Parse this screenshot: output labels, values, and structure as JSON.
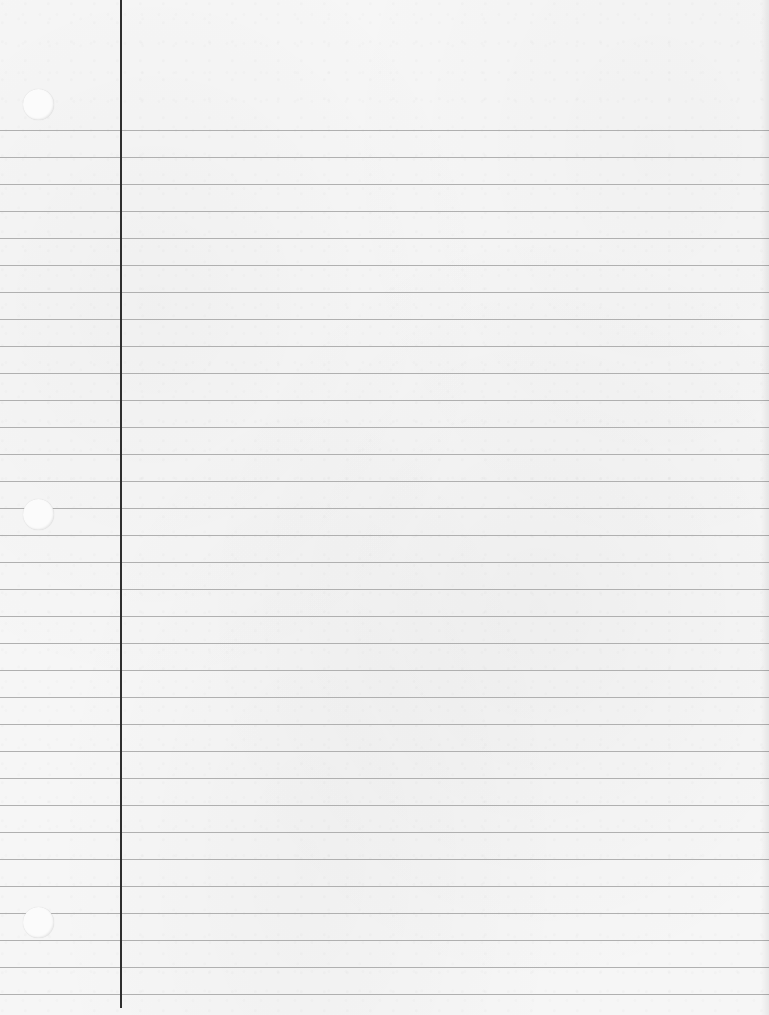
{
  "paper": {
    "type": "college-ruled notebook paper",
    "background_color": "#f6f6f6",
    "rule_color": "#a9a9a9",
    "margin_line_color": "#2f2f2f",
    "margin_line_x": 120,
    "rule_count": 33,
    "first_rule_y": 130,
    "rule_spacing": 27,
    "holes": [
      {
        "cx": 38,
        "cy": 104
      },
      {
        "cx": 38,
        "cy": 514
      },
      {
        "cx": 38,
        "cy": 922
      }
    ]
  }
}
